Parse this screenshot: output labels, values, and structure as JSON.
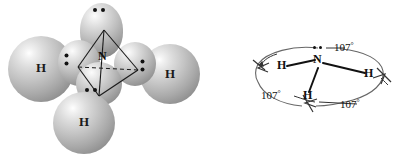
{
  "figure": {
    "caption": "",
    "colors": {
      "line": "#1a1a1a",
      "arc": "#555555",
      "sphere_light": "#ffffff",
      "sphere_mid": "#b4b4b4",
      "sphere_dark": "#6e6e6e",
      "background": "#ffffff"
    }
  },
  "model": {
    "title": "ammonia space-filling model with tetrahedral wireframe",
    "center_atom": {
      "symbol": "N"
    },
    "hydrogens": [
      {
        "symbol": "H",
        "position": "left"
      },
      {
        "symbol": "H",
        "position": "right"
      },
      {
        "symbol": "H",
        "position": "bottom"
      }
    ],
    "lone_pairs": [
      {
        "position": "top",
        "electrons": 2
      },
      {
        "position": "left",
        "electrons": 2
      },
      {
        "position": "right",
        "electrons": 2
      },
      {
        "position": "bottom",
        "electrons": 2
      }
    ]
  },
  "angle_diagram": {
    "title": "ammonia bond angle diagram",
    "center_atom": {
      "symbol": "N",
      "lone_pair_electrons": 2
    },
    "hydrogens": [
      {
        "symbol": "H",
        "position": "left"
      },
      {
        "symbol": "H",
        "position": "right"
      },
      {
        "symbol": "H",
        "position": "bottom"
      }
    ],
    "angles": [
      {
        "value": "107",
        "unit": "°",
        "position": "top-right"
      },
      {
        "value": "107",
        "unit": "°",
        "position": "bottom-left"
      },
      {
        "value": "107",
        "unit": "°",
        "position": "bottom-right"
      }
    ]
  }
}
